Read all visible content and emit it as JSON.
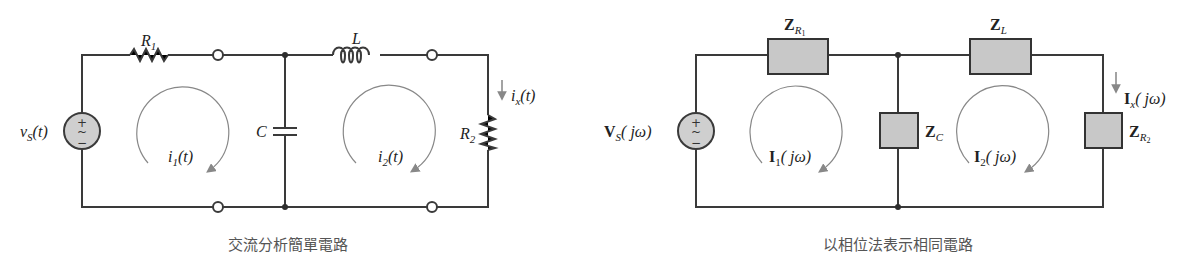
{
  "left_circuit": {
    "caption": "交流分析簡單電路",
    "source": {
      "label": "v",
      "sub": "S",
      "arg": "(t)"
    },
    "r1": {
      "label": "R",
      "sub": "1"
    },
    "inductor": {
      "label": "L"
    },
    "capacitor": {
      "label": "C"
    },
    "r2": {
      "label": "R",
      "sub": "2"
    },
    "loop1": {
      "label": "i",
      "sub": "1",
      "arg": "(t)"
    },
    "loop2": {
      "label": "i",
      "sub": "2",
      "arg": "(t)"
    },
    "branch_current": {
      "label": "i",
      "sub": "x",
      "arg": "(t)"
    }
  },
  "right_circuit": {
    "caption": "以相位法表示相同電路",
    "source": {
      "label": "V",
      "sub": "S",
      "arg": "( jω)"
    },
    "z_r1": {
      "label": "Z",
      "sub": "R",
      "subsub": "1"
    },
    "z_l": {
      "label": "Z",
      "sub": "L"
    },
    "z_c": {
      "label": "Z",
      "sub": "C"
    },
    "z_r2": {
      "label": "Z",
      "sub": "R",
      "subsub": "2"
    },
    "loop1": {
      "label": "I",
      "sub": "1",
      "arg": "( jω)"
    },
    "loop2": {
      "label": "I",
      "sub": "2",
      "arg": "( jω)"
    },
    "branch_current": {
      "label": "I",
      "sub": "x",
      "arg": "( jω)"
    }
  },
  "source_symbols": {
    "plus": "+",
    "tilde": "~",
    "minus": "−"
  },
  "colors": {
    "wire": "#3a3a3a",
    "box_fill": "#c8c8c8",
    "loop_arrow": "#888888",
    "caption": "#555555"
  }
}
